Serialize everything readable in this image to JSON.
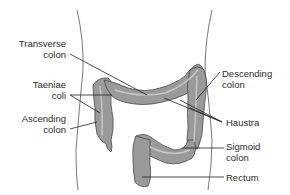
{
  "diagram": {
    "colors": {
      "colon_fill": "#9a9a9a",
      "colon_stroke": "#4a4a4a",
      "highlight": "#c8c8c8",
      "outline": "#555555",
      "leader": "#222222",
      "text": "#2a2a2a"
    },
    "labels": {
      "transverse_colon": {
        "line1": "Transverse",
        "line2": "colon"
      },
      "taeniae_coli": {
        "line1": "Taeniae",
        "line2": "coli"
      },
      "ascending_colon": {
        "line1": "Ascending",
        "line2": "colon"
      },
      "descending_colon": {
        "line1": "Descending",
        "line2": "colon"
      },
      "haustra": {
        "line1": "Haustra"
      },
      "sigmoid_colon": {
        "line1": "Sigmoid",
        "line2": "colon"
      },
      "rectum": {
        "line1": "Rectum"
      }
    }
  }
}
